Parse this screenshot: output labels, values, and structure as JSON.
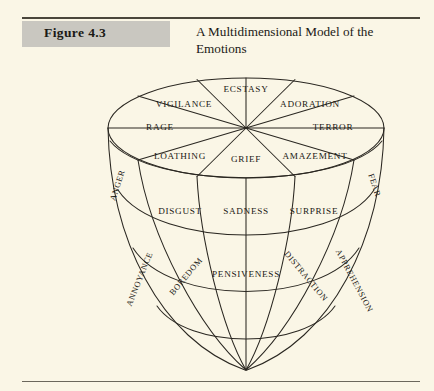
{
  "figure": {
    "label": "Figure 4.3",
    "title": "A Multidimensional Model of the Emotions",
    "badge_color": "#c9c7c0",
    "page_background": "#faf6e6",
    "ink_color": "#1b1915"
  },
  "diagram": {
    "name": "emotion-cone",
    "rings": [
      {
        "name": "top-ring-outer",
        "intensity": "most intense",
        "emotions": [
          "ECSTASY",
          "ADORATION",
          "TERROR",
          "AMAZEMENT",
          "GRIEF",
          "LOATHING",
          "RAGE",
          "VIGILANCE"
        ]
      },
      {
        "name": "middle-ring",
        "intensity": "moderate",
        "emotions": [
          "DISGUST",
          "SADNESS",
          "SURPRISE"
        ]
      },
      {
        "name": "lower-ring",
        "intensity": "least intense",
        "emotions": [
          "BOREDOM",
          "PENSIVENESS",
          "DISTRACTION"
        ]
      }
    ],
    "side_labels": [
      {
        "text": "ANGER",
        "position": "left-upper"
      },
      {
        "text": "FEAR",
        "position": "right-upper"
      },
      {
        "text": "ANNOYANCE",
        "position": "left-lower"
      },
      {
        "text": "APPREHENSION",
        "position": "right-lower"
      }
    ],
    "sector_labels": {
      "ecstasy": "ECSTASY",
      "adoration": "ADORATION",
      "vigilance": "VIGILANCE",
      "terror": "TERROR",
      "rage": "RAGE",
      "loathing": "LOATHING",
      "grief": "GRIEF",
      "amazement": "AMAZEMENT",
      "anger": "ANGER",
      "fear": "FEAR",
      "disgust": "DISGUST",
      "sadness": "SADNESS",
      "surprise": "SURPRISE",
      "annoyance": "ANNOYANCE",
      "boredom": "BOREDOM",
      "pensiveness": "PENSIVENESS",
      "distraction": "DISTRACTION",
      "apprehension": "APPREHENSION"
    }
  }
}
